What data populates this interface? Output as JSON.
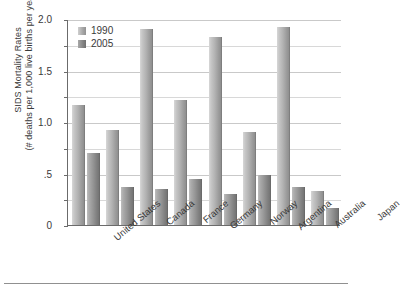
{
  "chart_data": {
    "type": "bar",
    "title": "",
    "xlabel": "",
    "ylabel": "SIDS Mortality Rates (# deaths per 1,000 live births per year)",
    "ylabel_line1": "SIDS Mortality Rates",
    "ylabel_line2": "(# deaths per 1,000 live births per year)",
    "categories": [
      "United States",
      "Canada",
      "France",
      "Germany",
      "Norway",
      "Argentina",
      "Australia",
      "Japan"
    ],
    "series": [
      {
        "name": "1990",
        "values": [
          1.17,
          0.92,
          1.9,
          1.21,
          1.83,
          0.9,
          1.92,
          0.33
        ]
      },
      {
        "name": "2005",
        "values": [
          0.7,
          0.37,
          0.35,
          0.45,
          0.3,
          0.49,
          0.37,
          0.17
        ]
      }
    ],
    "ylim": [
      0,
      2.0
    ],
    "ytick_values": [
      0,
      0.5,
      1.0,
      1.5,
      2.0
    ],
    "ytick_labels": [
      "0",
      ".5",
      "1.0",
      "1.5",
      "2.0"
    ],
    "minor_gridlines": [
      0.25,
      0.75,
      1.25,
      1.75
    ],
    "grid": true,
    "legend_position": "upper-left-inside",
    "colors": {
      "series_1990": "#b3b3b3",
      "series_2005": "#8a8a8a",
      "gridline": "#c9c9c9",
      "axis": "#6b6b6b",
      "background": "#ffffff"
    }
  }
}
